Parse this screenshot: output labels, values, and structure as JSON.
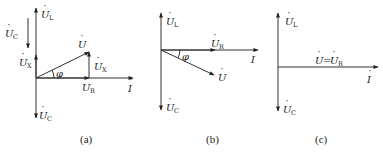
{
  "diagrams": [
    {
      "id": "a",
      "caption": "(a)",
      "labels": {
        "UL": {
          "base": "U",
          "sub": "L"
        },
        "UC_top": {
          "base": "U",
          "sub": "C"
        },
        "UX_left": {
          "base": "U",
          "sub": "X"
        },
        "U": {
          "base": "U",
          "sub": ""
        },
        "UX_right": {
          "base": "U",
          "sub": "X"
        },
        "phi": "φ",
        "UR": {
          "base": "U",
          "sub": "R"
        },
        "I": {
          "base": "I",
          "sub": ""
        },
        "UC_bottom": {
          "base": "U",
          "sub": "C"
        }
      }
    },
    {
      "id": "b",
      "caption": "(b)",
      "labels": {
        "UL": {
          "base": "U",
          "sub": "L"
        },
        "UR": {
          "base": "U",
          "sub": "R"
        },
        "phi": "φ",
        "I": {
          "base": "I",
          "sub": ""
        },
        "U": {
          "base": "U",
          "sub": ""
        },
        "UC": {
          "base": "U",
          "sub": "C"
        }
      }
    },
    {
      "id": "c",
      "caption": "(c)",
      "labels": {
        "UL": {
          "base": "U",
          "sub": "L"
        },
        "U_eq_UR": {
          "left": "U",
          "eq": "=",
          "right": "U",
          "sub": "R"
        },
        "I": {
          "base": "I",
          "sub": ""
        },
        "UC": {
          "base": "U",
          "sub": "C"
        }
      }
    }
  ]
}
